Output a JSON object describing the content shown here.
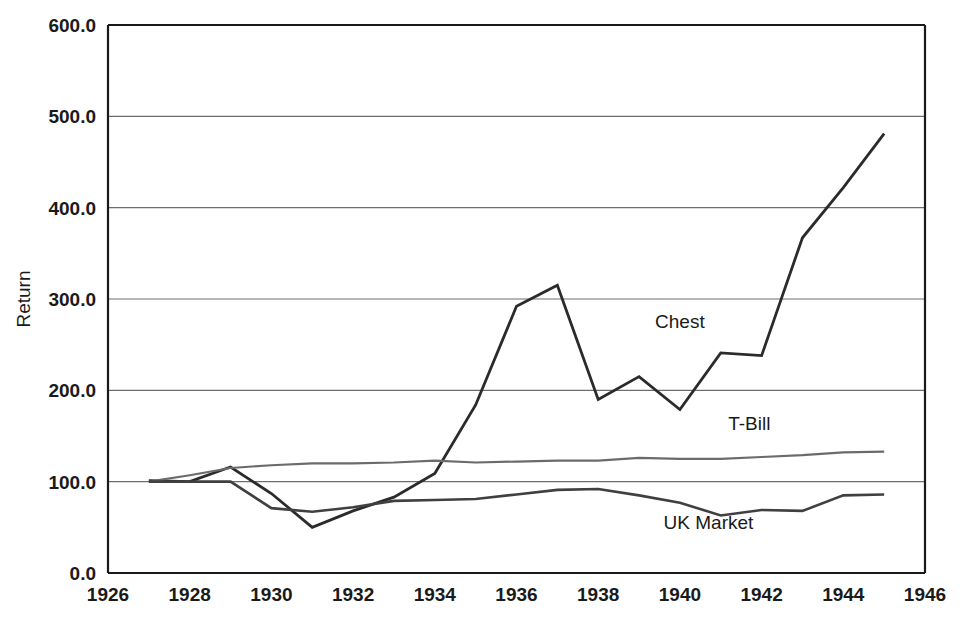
{
  "chart_data": {
    "type": "line",
    "title": "",
    "xlabel": "",
    "ylabel": "Return",
    "xlim": [
      1926,
      1946
    ],
    "ylim": [
      0.0,
      600.0
    ],
    "grid": true,
    "grid_axis": "y",
    "legend": "inline-annotations",
    "x_ticks": [
      "1926",
      "1928",
      "1930",
      "1932",
      "1934",
      "1936",
      "1938",
      "1940",
      "1942",
      "1944",
      "1946"
    ],
    "x_tick_values": [
      1926,
      1928,
      1930,
      1932,
      1934,
      1936,
      1938,
      1940,
      1942,
      1944,
      1946
    ],
    "y_ticks": [
      "0.0",
      "100.0",
      "200.0",
      "300.0",
      "400.0",
      "500.0",
      "600.0"
    ],
    "y_tick_values": [
      0.0,
      100.0,
      200.0,
      300.0,
      400.0,
      500.0,
      600.0
    ],
    "x": [
      1927,
      1928,
      1929,
      1930,
      1931,
      1932,
      1933,
      1934,
      1935,
      1936,
      1937,
      1938,
      1939,
      1940,
      1941,
      1942,
      1943,
      1944,
      1945
    ],
    "series": [
      {
        "name": "Chest",
        "color": "#2b2b2b",
        "width": 2.8,
        "label": "Chest",
        "label_x": 1940.0,
        "label_y": 268.0,
        "values": [
          101,
          100,
          116,
          87,
          50,
          68,
          83,
          109,
          184,
          292,
          315,
          190,
          215,
          179,
          241,
          238,
          367,
          422,
          481
        ]
      },
      {
        "name": "T-Bill",
        "color": "#6b6b6b",
        "width": 2.2,
        "label": "T-Bill",
        "label_x": 1941.7,
        "label_y": 157.0,
        "values": [
          100,
          107,
          115,
          118,
          120,
          120,
          121,
          123,
          121,
          122,
          123,
          123,
          126,
          125,
          125,
          127,
          129,
          132,
          133
        ]
      },
      {
        "name": "UK Market",
        "color": "#404040",
        "width": 2.6,
        "label": "UK Market",
        "label_x": 1940.7,
        "label_y": 48.0,
        "values": [
          100,
          100,
          100,
          71,
          67,
          72,
          79,
          80,
          81,
          86,
          91,
          92,
          85,
          77,
          63,
          69,
          68,
          85,
          86
        ]
      }
    ]
  },
  "axes": {
    "y_axis_title": "Return"
  }
}
